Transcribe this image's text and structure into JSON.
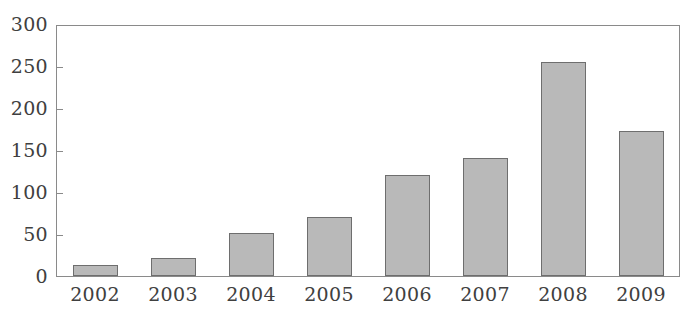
{
  "chart_data": {
    "type": "bar",
    "title": "",
    "subtitle": "",
    "xlabel": "",
    "ylabel": "",
    "categories": [
      "2002",
      "2003",
      "2004",
      "2005",
      "2006",
      "2007",
      "2008",
      "2009"
    ],
    "values": [
      13,
      21,
      52,
      71,
      121,
      141,
      257,
      174
    ],
    "series": [
      {
        "name": "",
        "values": [
          13,
          21,
          52,
          71,
          121,
          141,
          257,
          174
        ]
      }
    ],
    "ylim": [
      0,
      300
    ],
    "yticks": [
      0,
      50,
      100,
      150,
      200,
      250,
      300
    ],
    "ytick_labels": [
      "0",
      "50",
      "100",
      "150",
      "200",
      "250",
      "300"
    ],
    "xtick_labels": [
      "2002",
      "2003",
      "2004",
      "2005",
      "2006",
      "2007",
      "2008",
      "2009"
    ],
    "grid": false,
    "legend": false,
    "legend_position": "none",
    "bar_fill_color": "#b9b9b9",
    "bar_edge_color": "#6e6e6e",
    "axis_color": "#8a8a8a",
    "text_color": "#404040",
    "background_color": "#ffffff"
  }
}
